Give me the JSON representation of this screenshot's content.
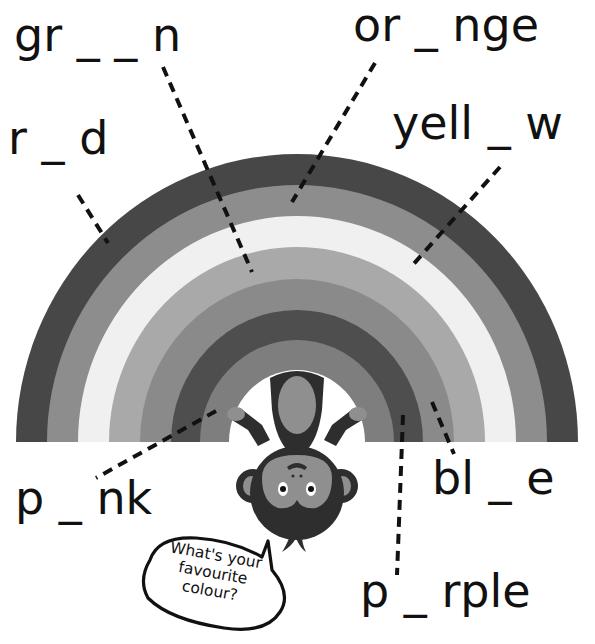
{
  "worksheet": {
    "words": [
      {
        "id": "green",
        "text": "gr _ _ n",
        "x": 14,
        "y": 12
      },
      {
        "id": "orange",
        "text": "or _ nge",
        "x": 353,
        "y": 2
      },
      {
        "id": "red",
        "text": "r _ d",
        "x": 8,
        "y": 115
      },
      {
        "id": "yellow",
        "text": "yell _ w",
        "x": 392,
        "y": 100
      },
      {
        "id": "pink",
        "text": "p _ nk",
        "x": 15,
        "y": 475
      },
      {
        "id": "blue",
        "text": "bl _ e",
        "x": 432,
        "y": 455
      },
      {
        "id": "purple",
        "text": "p _ rple",
        "x": 360,
        "y": 568
      }
    ],
    "speech_bubble": {
      "line1": "What's your",
      "line2": "favourite",
      "line3": "colour?"
    }
  },
  "rainbow": {
    "center_x": 297,
    "base_y": 442,
    "bands": [
      {
        "name": "red",
        "color": "#474747",
        "outer_rx": 281,
        "outer_ry": 288
      },
      {
        "name": "orange",
        "color": "#8d8d8d",
        "outer_rx": 250,
        "outer_ry": 257
      },
      {
        "name": "yellow",
        "color": "#f0f0f0",
        "outer_rx": 219,
        "outer_ry": 226
      },
      {
        "name": "green",
        "color": "#a9a9a9",
        "outer_rx": 188,
        "outer_ry": 195
      },
      {
        "name": "blue",
        "color": "#8a8a8a",
        "outer_rx": 157,
        "outer_ry": 163
      },
      {
        "name": "purple",
        "color": "#4e4e4e",
        "outer_rx": 126,
        "outer_ry": 132
      },
      {
        "name": "pink",
        "color": "#7e7e7e",
        "outer_rx": 97,
        "outer_ry": 102
      }
    ],
    "inner_rx": 68,
    "inner_ry": 72
  },
  "leader_lines": [
    {
      "label": "red",
      "x1": 78,
      "y1": 195,
      "x2": 108,
      "y2": 243
    },
    {
      "label": "green",
      "x1": 163,
      "y1": 67,
      "x2": 252,
      "y2": 272
    },
    {
      "label": "orange",
      "x1": 375,
      "y1": 63,
      "x2": 292,
      "y2": 202
    },
    {
      "label": "yellow",
      "x1": 500,
      "y1": 167,
      "x2": 410,
      "y2": 268
    },
    {
      "label": "pink",
      "x1": 216,
      "y1": 411,
      "x2": 96,
      "y2": 478
    },
    {
      "label": "blue",
      "x1": 432,
      "y1": 402,
      "x2": 454,
      "y2": 454
    },
    {
      "label": "purple",
      "x1": 403,
      "y1": 415,
      "x2": 397,
      "y2": 575
    }
  ],
  "colors": {
    "ink": "#111111",
    "monkey_fur": "#2e2e2e",
    "monkey_face": "#8f8f8f",
    "background": "#ffffff"
  }
}
